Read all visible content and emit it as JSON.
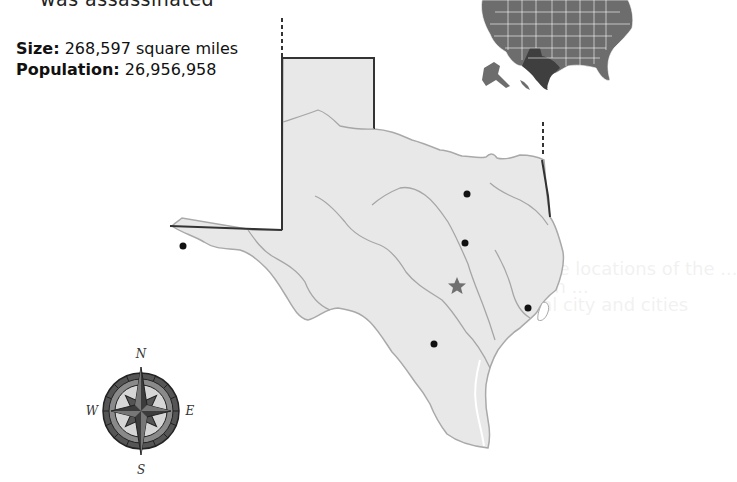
{
  "header": {
    "cut_off_text": "was assassinated"
  },
  "facts": {
    "size_label": "Size:",
    "size_value": "268,597 square miles",
    "population_label": "Population:",
    "population_value": "26,956,958"
  },
  "map": {
    "state": "Texas",
    "fill_color": "#e8e8e8",
    "border_color": "#333333",
    "river_color": "#a6a6a6",
    "capital_color": "#707070",
    "city_dot_color": "#111111",
    "markers": [
      {
        "type": "city",
        "x": 183,
        "y": 246
      },
      {
        "type": "city",
        "x": 467,
        "y": 194
      },
      {
        "type": "city",
        "x": 465,
        "y": 243
      },
      {
        "type": "capital-star",
        "x": 457,
        "y": 286
      },
      {
        "type": "city",
        "x": 528,
        "y": 308
      },
      {
        "type": "city",
        "x": 434,
        "y": 344
      }
    ]
  },
  "inset": {
    "label": "USA locator map",
    "highlight": "Texas",
    "state_color": "#6d6d6d",
    "highlight_color": "#3f3f3f"
  },
  "compass": {
    "n": "N",
    "e": "E",
    "s": "S",
    "w": "W"
  },
  "bleed_through": [
    "map that contain are locations of the ...",
    "the other region ...",
    "the cities of the capital city and cities"
  ]
}
